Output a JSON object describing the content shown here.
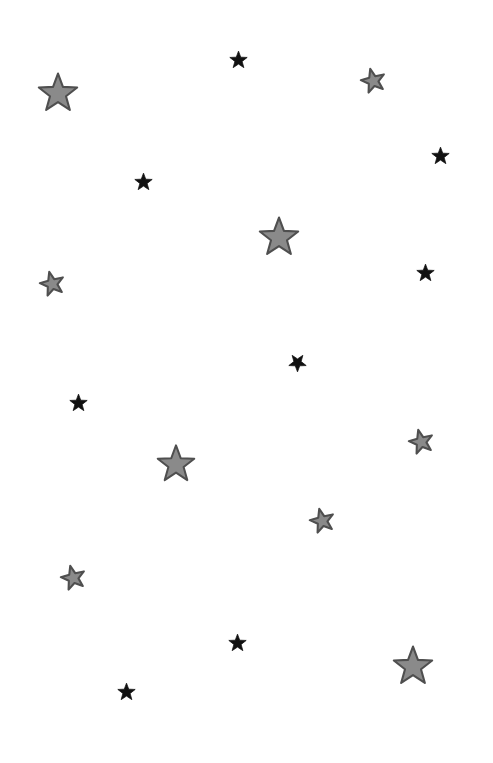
{
  "background": "#ffffff",
  "palette": {
    "gray_fill": "#8a8a8a",
    "gray_stroke": "#4f4f4f",
    "black_fill": "#111111"
  },
  "stars": [
    {
      "kind": "large-gray",
      "cx": 58,
      "cy": 92,
      "size": 42,
      "rotate": 0
    },
    {
      "kind": "small-black",
      "cx": 238,
      "cy": 59,
      "size": 19,
      "rotate": 0
    },
    {
      "kind": "small-gray",
      "cx": 373,
      "cy": 80,
      "size": 26,
      "rotate": -14
    },
    {
      "kind": "small-black",
      "cx": 440,
      "cy": 155,
      "size": 19,
      "rotate": 0
    },
    {
      "kind": "small-black",
      "cx": 143,
      "cy": 181,
      "size": 19,
      "rotate": 0
    },
    {
      "kind": "large-gray",
      "cx": 279,
      "cy": 236,
      "size": 42,
      "rotate": 0
    },
    {
      "kind": "small-gray",
      "cx": 52,
      "cy": 283,
      "size": 26,
      "rotate": -14
    },
    {
      "kind": "small-black",
      "cx": 425,
      "cy": 272,
      "size": 19,
      "rotate": 0
    },
    {
      "kind": "small-black",
      "cx": 297,
      "cy": 363,
      "size": 19,
      "rotate": 180
    },
    {
      "kind": "small-black",
      "cx": 78,
      "cy": 402,
      "size": 19,
      "rotate": 0
    },
    {
      "kind": "small-gray",
      "cx": 421,
      "cy": 441,
      "size": 26,
      "rotate": -14
    },
    {
      "kind": "large-gray",
      "cx": 176,
      "cy": 463,
      "size": 40,
      "rotate": 0
    },
    {
      "kind": "small-gray",
      "cx": 322,
      "cy": 520,
      "size": 26,
      "rotate": -14
    },
    {
      "kind": "small-gray",
      "cx": 73,
      "cy": 577,
      "size": 26,
      "rotate": -14
    },
    {
      "kind": "small-black",
      "cx": 237,
      "cy": 642,
      "size": 19,
      "rotate": 0
    },
    {
      "kind": "large-gray",
      "cx": 413,
      "cy": 665,
      "size": 42,
      "rotate": 0
    },
    {
      "kind": "small-black",
      "cx": 126,
      "cy": 691,
      "size": 19,
      "rotate": 0
    }
  ]
}
